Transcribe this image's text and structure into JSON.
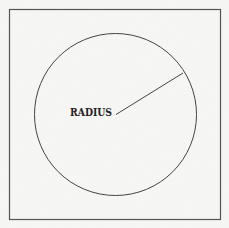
{
  "diagram": {
    "type": "geometry",
    "frame": {
      "x": 9.5,
      "y": 9.5,
      "width": 211,
      "height": 210,
      "stroke": "#555555"
    },
    "circle": {
      "cx": 115.5,
      "cy": 114.5,
      "r": 81,
      "stroke": "#444444"
    },
    "radius_line": {
      "x1": 116,
      "y1": 114.5,
      "x2": 183,
      "y2": 73,
      "stroke": "#444444"
    },
    "label": {
      "text": "RADIUS",
      "x": 70,
      "y": 115.5,
      "color": "#222222"
    }
  }
}
